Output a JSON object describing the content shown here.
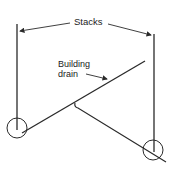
{
  "labels": {
    "stacks": "Stacks",
    "building_drain_line1": "Building",
    "building_drain_line2": "drain"
  },
  "colors": {
    "ink": "#2a2a2a",
    "background": "#ffffff"
  }
}
